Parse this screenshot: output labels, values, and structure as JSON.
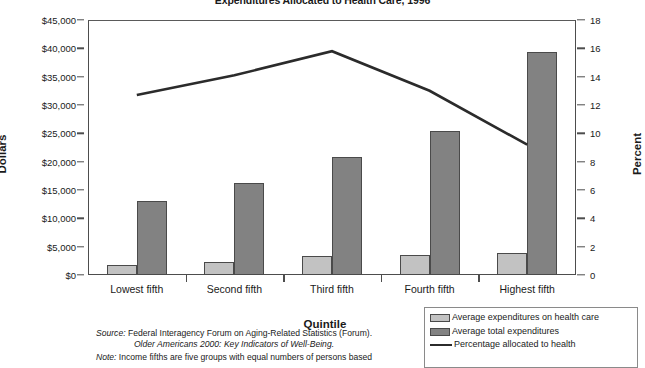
{
  "chart_data": {
    "type": "bar",
    "title": "Expenditures Allocated to Health Care, 1996",
    "xlabel": "Quintile",
    "ylabel": "Dollars",
    "y2label": "Percent",
    "categories": [
      "Lowest fifth",
      "Second fifth",
      "Third fifth",
      "Fourth fifth",
      "Highest fifth"
    ],
    "ylim": [
      0,
      45000
    ],
    "y2lim": [
      0,
      18
    ],
    "y_ticks": [
      "$0",
      "$5,000",
      "$10,000",
      "$15,000",
      "$20,000",
      "$25,000",
      "$30,000",
      "$35,000",
      "$40,000",
      "$45,000"
    ],
    "y_tick_values": [
      0,
      5000,
      10000,
      15000,
      20000,
      25000,
      30000,
      35000,
      40000,
      45000
    ],
    "y2_ticks": [
      "0",
      "2",
      "4",
      "6",
      "8",
      "10",
      "12",
      "14",
      "16",
      "18"
    ],
    "y2_tick_values": [
      0,
      2,
      4,
      6,
      8,
      10,
      12,
      14,
      16,
      18
    ],
    "grid": false,
    "legend_position": "bottom-right",
    "series": [
      {
        "name": "Average expenditures on health care",
        "type": "bar",
        "axis": "left",
        "color": "#c2c2c2",
        "values": [
          1700,
          2300,
          3300,
          3600,
          3900
        ]
      },
      {
        "name": "Average total expenditures",
        "type": "bar",
        "axis": "left",
        "color": "#828282",
        "values": [
          13100,
          16200,
          20800,
          25500,
          39300
        ]
      },
      {
        "name": "Percentage allocated to health",
        "type": "line",
        "axis": "right",
        "color": "#2b2b2b",
        "values": [
          12.7,
          14.1,
          15.8,
          13.0,
          9.2
        ]
      }
    ]
  },
  "legend": {
    "items": [
      {
        "label": "Average expenditures on health care",
        "swatch": "light"
      },
      {
        "label": "Average total expenditures",
        "swatch": "dark"
      },
      {
        "label": "Percentage allocated to health",
        "swatch": "line"
      }
    ]
  },
  "footnotes": {
    "source_label": "Source:",
    "source_text": " Federal Interagency Forum on Aging-Related Statistics (Forum).",
    "source_italic_line": "Older Americans 2000: Key Indicators of Well-Being.",
    "note_label": "Note:",
    "note_text": " Income fifths are five groups with equal numbers of persons based"
  }
}
